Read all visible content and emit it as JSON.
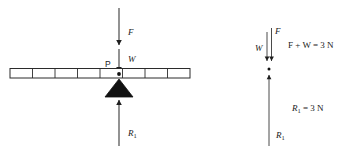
{
  "figure": {
    "background_color": "#ffffff",
    "line_color": "#2b2b2b"
  },
  "left_diagram": {
    "name": "ruler-on-fulcrum",
    "ruler": {
      "label": "ruler",
      "divisions": 8,
      "left_px": 10,
      "right_px": 190,
      "top_px": 68,
      "height_px": 10
    },
    "pivot": {
      "label": "P",
      "x_px": 119,
      "y_px": 74
    },
    "forces": [
      {
        "symbol": "F",
        "label": "F",
        "direction": "down",
        "from_y": 8,
        "to_y": 46,
        "x_px": 119,
        "label_x": 127,
        "label_y": 32
      },
      {
        "symbol": "W",
        "label": "W",
        "direction": "down",
        "from_y": 46,
        "to_y": 72,
        "x_px": 119,
        "label_x": 127,
        "label_y": 60
      },
      {
        "symbol": "R1",
        "label": "R",
        "subscript": "1",
        "direction": "up",
        "from_y": 146,
        "to_y": 106,
        "x_px": 119,
        "label_x": 127,
        "label_y": 133
      }
    ],
    "fulcrum": {
      "label": "fulcrum",
      "apex_x": 119,
      "apex_y": 79,
      "base_y": 97,
      "half_width": 14
    }
  },
  "right_diagram": {
    "name": "force-vector-summary",
    "vectors": [
      {
        "symbol": "W",
        "label": "W",
        "direction": "down",
        "x_px": 267,
        "from_y": 32,
        "to_y": 62,
        "label_x": 256,
        "label_y": 50
      },
      {
        "symbol": "F",
        "label": "F",
        "direction": "down",
        "x_px": 271,
        "from_y": 28,
        "to_y": 62,
        "label_x": 276,
        "label_y": 34
      },
      {
        "symbol": "R1",
        "label": "R",
        "subscript": "1",
        "direction": "up",
        "x_px": 269,
        "from_y": 146,
        "to_y": 70,
        "label_x": 276,
        "label_y": 136
      }
    ],
    "annotations": [
      {
        "name": "sum-of-downward-forces",
        "text": "F + W = 3 N",
        "x_px": 288,
        "y_px": 47
      },
      {
        "name": "reaction-force-value",
        "text": "R",
        "subscript": "1",
        "text_after": " = 3 N",
        "x_px": 292,
        "y_px": 110
      }
    ]
  },
  "symbols": {
    "force_applied": "F",
    "weight": "W",
    "reaction": "R",
    "reaction_subscript": "1",
    "pivot_point": "P",
    "unit_newton": "N",
    "value_newtons": "3"
  }
}
